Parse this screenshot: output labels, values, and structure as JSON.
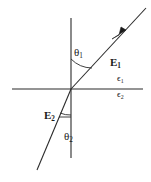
{
  "figure": {
    "kind": "optics-refraction-diagram",
    "width": 151,
    "height": 182,
    "background_color": "#ffffff",
    "stroke_color": "#2b2b2b",
    "text_color": "#1a1a1a"
  },
  "labels": {
    "theta1": {
      "symbol": "θ",
      "subscript": "1"
    },
    "theta2": {
      "symbol": "θ",
      "subscript": "2"
    },
    "E1": {
      "symbol": "E",
      "subscript": "1"
    },
    "E2": {
      "symbol": "E",
      "subscript": "2"
    },
    "epsilon1": {
      "symbol": "ϵ",
      "subscript": "1"
    },
    "epsilon2": {
      "symbol": "ϵ",
      "subscript": "2"
    }
  },
  "geometry": {
    "origin": {
      "x": 71,
      "y": 89
    },
    "interface_line": {
      "x1": 12,
      "y1": 89,
      "x2": 143,
      "y2": 89
    },
    "normal_axis": {
      "x1": 71,
      "y1": 18,
      "x2": 71,
      "y2": 158
    },
    "incident_ray": {
      "x1": 146,
      "y1": 8,
      "x2": 71,
      "y2": 89
    },
    "refracted_ray": {
      "x1": 71,
      "y1": 89,
      "x2": 37,
      "y2": 170
    },
    "arrow_head": {
      "x": 118,
      "y": 33,
      "direction": "down-left"
    },
    "angle_arc_theta1": {
      "radius": 30,
      "from": "normal-up",
      "to": "incident-ray"
    },
    "angle_arc_theta2": {
      "radius": 26,
      "from": "normal-down",
      "to": "refracted-ray"
    },
    "tick_E2": {
      "x1": 58,
      "y1": 117,
      "x2": 71,
      "y2": 117
    }
  }
}
